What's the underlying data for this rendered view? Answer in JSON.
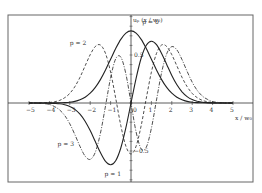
{
  "chart_data": {
    "type": "line",
    "title": "",
    "xlabel": "x / w₀",
    "ylabel": "uₚ (x / w₀)",
    "xlim": [
      -5.5,
      5.5
    ],
    "ylim": [
      -0.8,
      0.95
    ],
    "grid": false,
    "x_ticks": [
      -5,
      -4,
      -3,
      -2,
      -1,
      0,
      1,
      2,
      3,
      4,
      5
    ],
    "x_tick_labels": [
      "−5",
      "−4",
      "−3",
      "−2",
      "−1",
      "0",
      "1",
      "2",
      "3",
      "4",
      "5"
    ],
    "y_ticks": [
      0.5,
      -0.5
    ],
    "y_tick_labels": [
      "0.5",
      "−0.5"
    ],
    "x_half": [
      0,
      0.25,
      0.5,
      0.75,
      1,
      1.25,
      1.5,
      1.75,
      2,
      2.25,
      2.5,
      2.75,
      3,
      3.25,
      3.5,
      3.75,
      4,
      4.25,
      4.5,
      4.75,
      5
    ],
    "series": [
      {
        "name": "p = 0",
        "parity": "even",
        "style": "solid",
        "label_pos": [
          0.55,
          0.82
        ],
        "values_half": [
          0.751,
          0.728,
          0.663,
          0.567,
          0.456,
          0.344,
          0.244,
          0.162,
          0.102,
          0.06,
          0.033,
          0.017,
          0.008,
          0.004,
          0.002,
          0.001,
          0,
          0,
          0,
          0,
          0
        ]
      },
      {
        "name": "p = 1",
        "parity": "odd",
        "style": "solid",
        "label_pos": [
          -1.3,
          -0.76
        ],
        "values_half": [
          0,
          0.257,
          0.469,
          0.601,
          0.644,
          0.608,
          0.517,
          0.402,
          0.287,
          0.19,
          0.117,
          0.067,
          0.035,
          0.018,
          0.008,
          0.004,
          0.001,
          0,
          0,
          0,
          0
        ]
      },
      {
        "name": "p = 2",
        "parity": "even",
        "style": "dashed",
        "label_pos": [
          -3.0,
          0.6
        ],
        "values_half": [
          -0.531,
          -0.45,
          -0.234,
          0.05,
          0.322,
          0.517,
          0.604,
          0.589,
          0.503,
          0.386,
          0.268,
          0.171,
          0.1,
          0.055,
          0.027,
          0.013,
          0.005,
          0.002,
          0,
          0,
          0
        ]
      },
      {
        "name": "p = 3",
        "parity": "odd",
        "style": "dashdot",
        "label_pos": [
          -3.6,
          -0.45
        ],
        "values_half": [
          0,
          -0.302,
          -0.478,
          -0.46,
          -0.263,
          0.031,
          0.317,
          0.513,
          0.587,
          0.553,
          0.452,
          0.33,
          0.217,
          0.13,
          0.072,
          0.037,
          0.015,
          0.006,
          0.002,
          0,
          0
        ]
      }
    ],
    "legend": "inline labels"
  },
  "layout": {
    "frame": {
      "x0": 8,
      "y0": 15,
      "x1": 253,
      "y1": 182
    },
    "origin_px": [
      131,
      103
    ],
    "px_per_x": 20.4,
    "px_per_y": 96,
    "line_color": "#222222",
    "frame_color": "#666666"
  }
}
